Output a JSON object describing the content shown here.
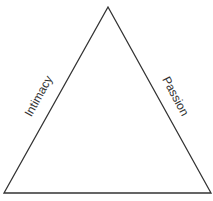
{
  "diagram": {
    "type": "triangle",
    "sides": {
      "left": "Intimacy",
      "right": "Passion",
      "bottom": ""
    },
    "stroke_color": "#333333",
    "background": "#ffffff"
  }
}
